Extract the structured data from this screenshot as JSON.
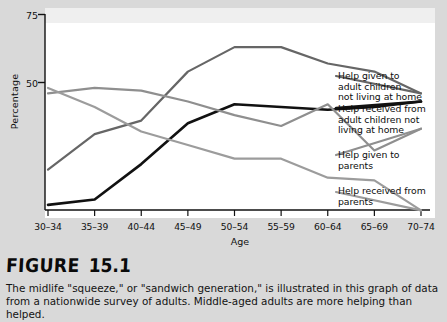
{
  "figure": {
    "head_word": "FIGURE",
    "head_number": "15.1",
    "caption_line1": "The midlife \"squeeze,\" or \"sandwich generation,\" is illustrated in this graph of data",
    "caption_line2": "from a nationwide survey of adults. Middle-aged adults are more helping than helped."
  },
  "chart_data": {
    "type": "line",
    "title": "",
    "xlabel": "Age",
    "ylabel": "Percentage",
    "ylim": [
      0,
      75
    ],
    "yticks": [
      50,
      75
    ],
    "ytick_labels": [
      "50",
      "75"
    ],
    "grid": false,
    "legend_position": "right",
    "categories": [
      "30–34",
      "35–39",
      "40–44",
      "45–49",
      "50–54",
      "55–59",
      "60–64",
      "65–69",
      "70–74"
    ],
    "series": [
      {
        "name": "Help given to adult children not living at home",
        "label_line1": "Help given to",
        "label_line2": "adult children",
        "label_line3": "not living at home",
        "color": "#666666",
        "values": [
          18,
          31,
          36,
          54,
          63,
          63,
          57,
          54,
          46
        ]
      },
      {
        "name": "Help received from adult children not living at home",
        "label_line1": "Help received from",
        "label_line2": "adult children not",
        "label_line3": "living at home",
        "color": "#111111",
        "values": [
          5,
          7,
          20,
          35,
          42,
          41,
          40,
          41,
          43
        ]
      },
      {
        "name": "Help given to parents",
        "label_line1": "Help given to",
        "label_line2": "parents",
        "color": "#8f8f8f",
        "values": [
          46,
          48,
          47,
          43,
          38,
          34,
          42,
          25,
          33
        ]
      },
      {
        "name": "Help received from parents",
        "label_line1": "Help received from",
        "label_line2": "parents",
        "color": "#9c9c9c",
        "values": [
          48,
          41,
          32,
          27,
          22,
          22,
          15,
          14,
          3
        ]
      }
    ]
  }
}
